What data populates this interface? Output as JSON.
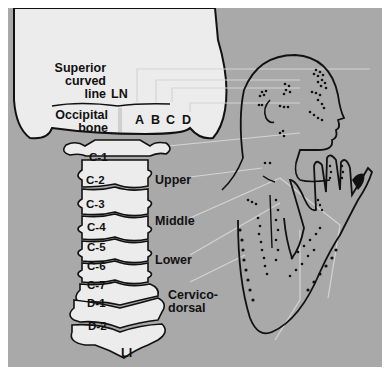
{
  "figure": {
    "skull_labels": {
      "superior_curved_line": [
        "Superior",
        "curved",
        "line"
      ],
      "ln": "LN",
      "occipital_bone": [
        "Occipital",
        "bone"
      ],
      "points": [
        "A",
        "B",
        "C",
        "D"
      ]
    },
    "vertebrae": [
      "C-1",
      "C-2",
      "C-3",
      "C-4",
      "C-5",
      "C-6",
      "C-7",
      "D-1",
      "D-2"
    ],
    "regions": {
      "upper": "Upper",
      "middle": "Middle",
      "lower": "Lower",
      "cervicodorsal": [
        "Cervico-",
        "dorsal"
      ]
    },
    "bottom_label": "LI",
    "colors": {
      "background": "#a9a9a9",
      "bone": "#ececec",
      "outline": "#111111",
      "leader_line": "#d0d0d0"
    }
  }
}
